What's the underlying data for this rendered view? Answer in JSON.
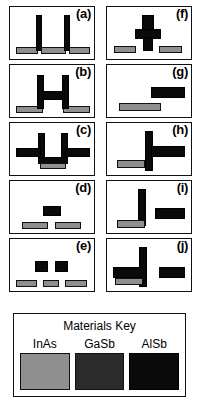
{
  "figure": {
    "caption_labels": [
      "(a)",
      "(b)",
      "(c)",
      "(d)",
      "(e)",
      "(f)",
      "(g)",
      "(h)",
      "(i)",
      "(j)"
    ],
    "materials": {
      "inas": {
        "name": "InAs",
        "color": "#8f8f8f"
      },
      "gasb": {
        "name": "GaSb",
        "color": "#2b2b2b"
      },
      "alsb": {
        "name": "AlSb",
        "color": "#0a0a0a"
      }
    },
    "key": {
      "title": "Materials Key",
      "swatches": [
        {
          "label": "InAs",
          "color": "#8f8f8f"
        },
        {
          "label": "GaSb",
          "color": "#2b2b2b"
        },
        {
          "label": "AlSb",
          "color": "#0a0a0a"
        }
      ]
    },
    "panels": [
      {
        "id": "a",
        "label": "(a)",
        "blocks": [
          {
            "material": "inas",
            "x": 6,
            "y": 40,
            "w": 22,
            "h": 7
          },
          {
            "material": "inas",
            "x": 31,
            "y": 40,
            "w": 25,
            "h": 7
          },
          {
            "material": "inas",
            "x": 59,
            "y": 40,
            "w": 21,
            "h": 7
          },
          {
            "material": "alsb",
            "x": 26,
            "y": 8,
            "w": 6,
            "h": 36
          },
          {
            "material": "alsb",
            "x": 54,
            "y": 8,
            "w": 6,
            "h": 36
          }
        ]
      },
      {
        "id": "b",
        "label": "(b)",
        "blocks": [
          {
            "material": "inas",
            "x": 6,
            "y": 41,
            "w": 27,
            "h": 7
          },
          {
            "material": "inas",
            "x": 53,
            "y": 41,
            "w": 27,
            "h": 7
          },
          {
            "material": "alsb",
            "x": 27,
            "y": 10,
            "w": 7,
            "h": 34
          },
          {
            "material": "alsb",
            "x": 52,
            "y": 10,
            "w": 7,
            "h": 34
          },
          {
            "material": "alsb",
            "x": 33,
            "y": 26,
            "w": 20,
            "h": 9
          }
        ]
      },
      {
        "id": "c",
        "label": "(c)",
        "blocks": [
          {
            "material": "alsb",
            "x": 28,
            "y": 10,
            "w": 7,
            "h": 30
          },
          {
            "material": "alsb",
            "x": 51,
            "y": 10,
            "w": 7,
            "h": 30
          },
          {
            "material": "alsb",
            "x": 6,
            "y": 25,
            "w": 25,
            "h": 9
          },
          {
            "material": "alsb",
            "x": 55,
            "y": 25,
            "w": 25,
            "h": 9
          },
          {
            "material": "alsb",
            "x": 28,
            "y": 34,
            "w": 30,
            "h": 7
          },
          {
            "material": "inas",
            "x": 30,
            "y": 40,
            "w": 26,
            "h": 6
          }
        ]
      },
      {
        "id": "d",
        "label": "(d)",
        "blocks": [
          {
            "material": "alsb",
            "x": 33,
            "y": 25,
            "w": 18,
            "h": 10
          },
          {
            "material": "inas",
            "x": 12,
            "y": 41,
            "w": 26,
            "h": 7
          },
          {
            "material": "inas",
            "x": 45,
            "y": 41,
            "w": 26,
            "h": 7
          }
        ]
      },
      {
        "id": "e",
        "label": "(e)",
        "blocks": [
          {
            "material": "alsb",
            "x": 25,
            "y": 22,
            "w": 13,
            "h": 11
          },
          {
            "material": "alsb",
            "x": 45,
            "y": 22,
            "w": 13,
            "h": 11
          },
          {
            "material": "inas",
            "x": 6,
            "y": 41,
            "w": 21,
            "h": 7
          },
          {
            "material": "inas",
            "x": 33,
            "y": 41,
            "w": 16,
            "h": 7
          },
          {
            "material": "inas",
            "x": 55,
            "y": 41,
            "w": 22,
            "h": 7
          }
        ]
      },
      {
        "id": "f",
        "label": "(f)",
        "blocks": [
          {
            "material": "alsb",
            "x": 35,
            "y": 8,
            "w": 12,
            "h": 22
          },
          {
            "material": "alsb",
            "x": 28,
            "y": 22,
            "w": 26,
            "h": 10
          },
          {
            "material": "alsb",
            "x": 36,
            "y": 30,
            "w": 10,
            "h": 14
          },
          {
            "material": "inas",
            "x": 7,
            "y": 39,
            "w": 22,
            "h": 7
          },
          {
            "material": "inas",
            "x": 52,
            "y": 39,
            "w": 23,
            "h": 7
          }
        ]
      },
      {
        "id": "g",
        "label": "(g)",
        "blocks": [
          {
            "material": "alsb",
            "x": 44,
            "y": 22,
            "w": 34,
            "h": 11
          },
          {
            "material": "inas",
            "x": 12,
            "y": 38,
            "w": 42,
            "h": 8
          }
        ]
      },
      {
        "id": "h",
        "label": "(h)",
        "blocks": [
          {
            "material": "alsb",
            "x": 38,
            "y": 8,
            "w": 8,
            "h": 40
          },
          {
            "material": "alsb",
            "x": 44,
            "y": 23,
            "w": 34,
            "h": 11
          },
          {
            "material": "inas",
            "x": 10,
            "y": 37,
            "w": 28,
            "h": 8
          }
        ]
      },
      {
        "id": "i",
        "label": "(i)",
        "blocks": [
          {
            "material": "alsb",
            "x": 31,
            "y": 8,
            "w": 8,
            "h": 37
          },
          {
            "material": "alsb",
            "x": 48,
            "y": 27,
            "w": 30,
            "h": 11
          },
          {
            "material": "inas",
            "x": 10,
            "y": 39,
            "w": 28,
            "h": 8
          }
        ]
      },
      {
        "id": "j",
        "label": "(j)",
        "blocks": [
          {
            "material": "alsb",
            "x": 32,
            "y": 8,
            "w": 8,
            "h": 40
          },
          {
            "material": "alsb",
            "x": 6,
            "y": 28,
            "w": 34,
            "h": 11
          },
          {
            "material": "alsb",
            "x": 52,
            "y": 28,
            "w": 26,
            "h": 11
          },
          {
            "material": "inas",
            "x": 8,
            "y": 39,
            "w": 28,
            "h": 7
          }
        ]
      }
    ]
  }
}
